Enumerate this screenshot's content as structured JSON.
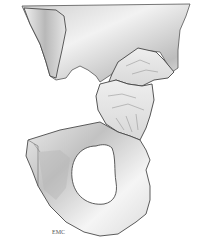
{
  "illustration": {
    "subject": "hip bone (os coxae) with fractured acetabular region",
    "signature": "EMC",
    "colors": {
      "background": "#ffffff",
      "bone_light": "#f4f4f4",
      "bone_mid": "#d6d6d6",
      "bone_shadow": "#9a9a9a",
      "outline": "#4a4a4a"
    }
  }
}
